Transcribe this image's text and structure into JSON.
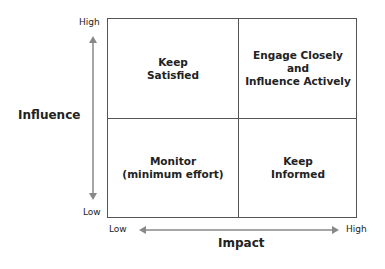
{
  "diagram": {
    "type": "2x2 stakeholder matrix",
    "y_axis": {
      "title": "Influence",
      "high_label": "High",
      "low_label": "Low"
    },
    "x_axis": {
      "title": "Impact",
      "low_label": "Low",
      "high_label": "High"
    },
    "quadrants": {
      "top_left": "Keep\nSatisfied",
      "top_right": "Engage Closely\nand\nInfluence Actively",
      "bottom_left": "Monitor\n(minimum effort)",
      "bottom_right": "Keep\nInformed"
    },
    "colors": {
      "border": "#555555",
      "arrow": "#888888",
      "text": "#222222"
    }
  }
}
